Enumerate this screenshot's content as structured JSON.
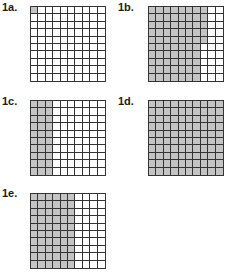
{
  "colors": {
    "shaded": "#c4c4c4",
    "unshaded": "#ffffff",
    "line": "#333333"
  },
  "grids": [
    {
      "id": "1a",
      "label": "1a.",
      "rows": 10,
      "cols": 10,
      "shaded_per_row": [
        1,
        0,
        0,
        0,
        0,
        0,
        0,
        0,
        0,
        0
      ],
      "shaded_total": 1,
      "label_pos": [
        2,
        2
      ],
      "grid_pos": [
        30,
        6
      ]
    },
    {
      "id": "1b",
      "label": "1b.",
      "rows": 10,
      "cols": 10,
      "shaded_per_row": [
        8,
        8,
        8,
        8,
        8,
        7,
        7,
        7,
        7,
        7
      ],
      "shaded_total": 75,
      "label_pos": [
        118,
        2
      ],
      "grid_pos": [
        148,
        6
      ]
    },
    {
      "id": "1c",
      "label": "1c.",
      "rows": 10,
      "cols": 10,
      "shaded_per_row": [
        3,
        3,
        3,
        3,
        3,
        3,
        3,
        3,
        3,
        3
      ],
      "shaded_total": 30,
      "label_pos": [
        2,
        96
      ],
      "grid_pos": [
        30,
        100
      ]
    },
    {
      "id": "1d",
      "label": "1d.",
      "rows": 10,
      "cols": 10,
      "shaded_per_row": [
        10,
        10,
        10,
        10,
        10,
        10,
        10,
        10,
        10,
        10
      ],
      "shaded_total": 100,
      "label_pos": [
        118,
        96
      ],
      "grid_pos": [
        148,
        100
      ]
    },
    {
      "id": "1e",
      "label": "1e.",
      "rows": 10,
      "cols": 10,
      "shaded_per_row": [
        6,
        6,
        6,
        6,
        6,
        6,
        6,
        6,
        6,
        6
      ],
      "shaded_total": 60,
      "label_pos": [
        2,
        188
      ],
      "grid_pos": [
        30,
        193
      ]
    }
  ]
}
